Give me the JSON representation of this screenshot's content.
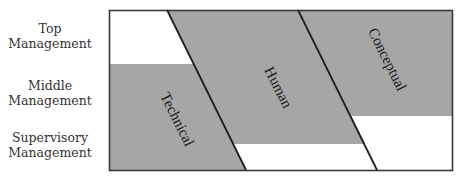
{
  "levels": [
    {
      "line1": "Top",
      "line2": "Management"
    },
    {
      "line1": "Middle",
      "line2": "Management"
    },
    {
      "line1": "Supervisory",
      "line2": "Management"
    }
  ],
  "skills": [
    {
      "label": "Technical"
    },
    {
      "label": "Human"
    },
    {
      "label": "Conceptual"
    }
  ],
  "colors": {
    "fill": "#a6a6a6",
    "line": "#2b2b2b",
    "background": "#ffffff"
  }
}
